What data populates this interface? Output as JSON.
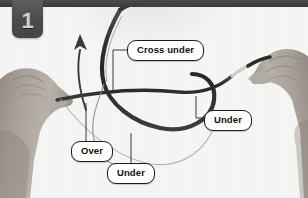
{
  "step": {
    "number": "1"
  },
  "colors": {
    "background": "#f4f4f2",
    "badge": "#4b4b4b",
    "badge_text": "#cfcfcf",
    "top_rail": "#3f3f3f",
    "label_fill": "#ffffff",
    "label_border": "#1d1d1d",
    "label_text": "#111111",
    "rope_dark": "#2e2e2e",
    "rope_light": "#9a9a9a",
    "arrow": "#3a3a3a",
    "skin": "#a9a29b",
    "leader_line": "#3a3a3a"
  },
  "labels": [
    {
      "id": "cross-under",
      "text": "Cross under"
    },
    {
      "id": "under-right",
      "text": "Under"
    },
    {
      "id": "over",
      "text": "Over"
    },
    {
      "id": "under-bottom",
      "text": "Under"
    }
  ],
  "figure": {
    "arrow_name": "motion-arrow",
    "left_hand": "left-hand",
    "right_hand": "right-hand",
    "rope": "rope-cord"
  }
}
